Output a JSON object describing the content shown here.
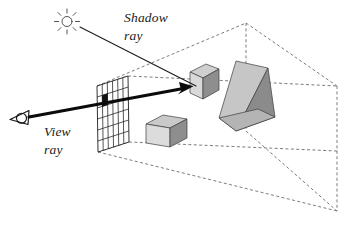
{
  "figure": {
    "background_color": "#ffffff"
  },
  "labels": {
    "shadow_ray_line1": "Shadow",
    "shadow_ray_line2": "ray",
    "view_ray_line1": "View",
    "view_ray_line2": "ray"
  },
  "icons": {
    "light_source": "sun-icon",
    "camera": "eye-icon"
  },
  "colors": {
    "ink": "#1b1b1b",
    "ray_black": "#0b0b0b",
    "dashed_gray": "#6d6d6d",
    "cube_top": "#c9c9c9",
    "cube_left": "#d8d8d8",
    "cube_right": "#8e8e8e",
    "wedge_front": "#c4c4c4",
    "wedge_side": "#8b8b8b",
    "wedge_base": "#b0b0b0",
    "grid_stroke": "#1d1d1d",
    "pixel_hit": "#111111",
    "background": "#ffffff"
  },
  "scene": {
    "image_plane": {
      "name": "image-plane-grid",
      "columns": 6,
      "rows": 6,
      "highlighted_pixel": {
        "column": 1,
        "row": 2
      }
    },
    "objects": [
      {
        "name": "upper-cube",
        "shape": "cube"
      },
      {
        "name": "lower-box",
        "shape": "box"
      },
      {
        "name": "wedge-prism",
        "shape": "triangular-prism"
      }
    ],
    "view_frustum": {
      "name": "view-frustum",
      "style": "dashed"
    }
  }
}
